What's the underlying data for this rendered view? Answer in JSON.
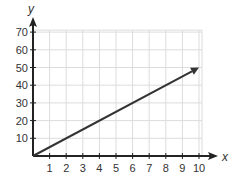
{
  "chart_data": {
    "type": "line",
    "title": "",
    "xlabel": "x",
    "ylabel": "y",
    "xlim": [
      0,
      10
    ],
    "ylim": [
      0,
      70
    ],
    "x_ticks": [
      1,
      2,
      3,
      4,
      5,
      6,
      7,
      8,
      9,
      10
    ],
    "y_ticks": [
      10,
      20,
      30,
      40,
      50,
      60,
      70
    ],
    "grid": true,
    "legend": null,
    "series": [
      {
        "name": "line",
        "x": [
          0,
          10
        ],
        "y": [
          0,
          50
        ],
        "arrow_end": true
      }
    ]
  },
  "colors": {
    "grid": "#dcdcdc",
    "axis": "#222222",
    "line": "#333333"
  }
}
